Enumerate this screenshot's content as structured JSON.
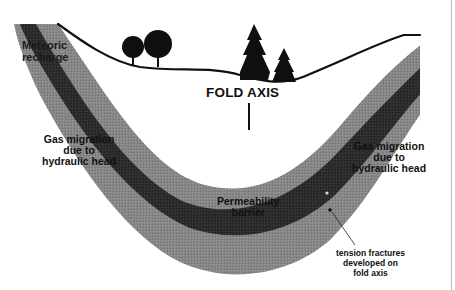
{
  "diagram": {
    "type": "geologic-cross-section",
    "colors": {
      "outer_band": "#8a8a8a",
      "inner_band": "#2e2e2e",
      "ground_line": "#111111",
      "trees": "#0f0f0f",
      "background": "#ffffff",
      "text": "#111111"
    }
  },
  "labels": {
    "fold_axis": "FOLD AXIS",
    "meteoric_recharge": [
      "Meteoric",
      "recharge"
    ],
    "gas_migration_left": [
      "Gas migration",
      "due to",
      "hydraulic head"
    ],
    "gas_migration_right": [
      "Gas migration",
      "due to",
      "hydraulic head"
    ],
    "permeability_barrier": [
      "Permeability",
      "barrier"
    ],
    "tension_fractures": [
      "tension fractures",
      "developed on",
      "fold axis"
    ]
  },
  "features": {
    "trees_left": [
      "deciduous-tree",
      "deciduous-tree"
    ],
    "trees_center": [
      "conifer-tree",
      "conifer-tree"
    ],
    "fold_axis_marker": "vertical-line",
    "fracture_points": 2
  }
}
